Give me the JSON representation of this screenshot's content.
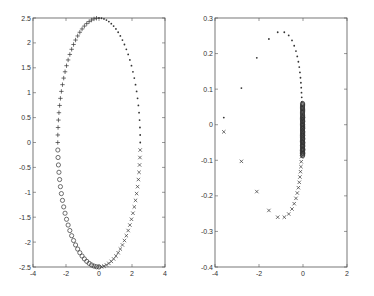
{
  "chart_data": [
    {
      "type": "scatter",
      "title": "",
      "xlabel": "",
      "ylabel": "",
      "xlim": [
        -4,
        4
      ],
      "ylim": [
        -2.5,
        2.5
      ],
      "xticks": [
        -4,
        -2,
        0,
        2,
        4
      ],
      "yticks": [
        -2.5,
        -2,
        -1.5,
        -1,
        -0.5,
        0,
        0.5,
        1,
        1.5,
        2,
        2.5
      ],
      "grid": false,
      "legend": null,
      "box": {
        "left": 33,
        "top": 18,
        "right": 165,
        "bottom": 267
      },
      "description": "Ellipse x=2.5cos(t), y=2.5sin(t) sampled; marker depends on quadrant",
      "series": [
        {
          "name": "upper-left",
          "marker": "+",
          "x_range": [
            -2.5,
            0
          ],
          "y_range": [
            0,
            2.5
          ]
        },
        {
          "name": "upper-right",
          "marker": ".",
          "x_range": [
            0,
            2.5
          ],
          "y_range": [
            0,
            2.5
          ]
        },
        {
          "name": "lower-left",
          "marker": "o",
          "x_range": [
            -2.5,
            0
          ],
          "y_range": [
            -2.5,
            0
          ]
        },
        {
          "name": "lower-right",
          "marker": "x",
          "x_range": [
            0,
            2.5
          ],
          "y_range": [
            -2.5,
            0
          ]
        }
      ],
      "params": {
        "a": 2.5,
        "b": 2.5,
        "n_per_quadrant": 26
      }
    },
    {
      "type": "scatter",
      "title": "",
      "xlabel": "",
      "ylabel": "",
      "xlim": [
        -4,
        2
      ],
      "ylim": [
        -0.4,
        0.3
      ],
      "xticks": [
        -4,
        -2,
        0,
        2
      ],
      "yticks": [
        -0.4,
        -0.3,
        -0.2,
        -0.1,
        0,
        0.1,
        0.2,
        0.3
      ],
      "grid": false,
      "legend": null,
      "box": {
        "left": 215,
        "top": 18,
        "right": 347,
        "bottom": 267
      },
      "series": [
        {
          "name": "upper",
          "marker": ".",
          "points": [
            [
              -3.6,
              0.02
            ],
            [
              -2.8,
              0.103
            ],
            [
              -2.1,
              0.188
            ],
            [
              -1.55,
              0.241
            ],
            [
              -1.15,
              0.26
            ],
            [
              -0.85,
              0.26
            ],
            [
              -0.65,
              0.251
            ],
            [
              -0.5,
              0.237
            ],
            [
              -0.4,
              0.222
            ],
            [
              -0.32,
              0.207
            ],
            [
              -0.26,
              0.192
            ],
            [
              -0.21,
              0.177
            ],
            [
              -0.17,
              0.162
            ],
            [
              -0.14,
              0.147
            ],
            [
              -0.115,
              0.132
            ],
            [
              -0.095,
              0.118
            ],
            [
              -0.08,
              0.104
            ],
            [
              -0.068,
              0.09
            ],
            [
              -0.058,
              0.077
            ],
            [
              -0.05,
              0.064
            ],
            [
              -0.043,
              0.052
            ],
            [
              -0.037,
              0.041
            ],
            [
              -0.032,
              0.03
            ],
            [
              -0.027,
              0.02
            ],
            [
              -0.022,
              0.011
            ],
            [
              -0.018,
              0.004
            ]
          ]
        },
        {
          "name": "lower",
          "marker": "x",
          "points": [
            [
              -3.6,
              -0.02
            ],
            [
              -2.8,
              -0.103
            ],
            [
              -2.1,
              -0.188
            ],
            [
              -1.55,
              -0.241
            ],
            [
              -1.15,
              -0.26
            ],
            [
              -0.85,
              -0.26
            ],
            [
              -0.65,
              -0.251
            ],
            [
              -0.5,
              -0.237
            ],
            [
              -0.4,
              -0.222
            ],
            [
              -0.32,
              -0.207
            ],
            [
              -0.26,
              -0.192
            ],
            [
              -0.21,
              -0.177
            ],
            [
              -0.17,
              -0.162
            ],
            [
              -0.14,
              -0.147
            ],
            [
              -0.115,
              -0.132
            ],
            [
              -0.095,
              -0.118
            ],
            [
              -0.08,
              -0.104
            ],
            [
              -0.068,
              -0.09
            ],
            [
              -0.058,
              -0.077
            ],
            [
              -0.05,
              -0.064
            ],
            [
              -0.043,
              -0.052
            ],
            [
              -0.037,
              -0.041
            ],
            [
              -0.032,
              -0.03
            ],
            [
              -0.027,
              -0.02
            ],
            [
              -0.022,
              -0.011
            ],
            [
              -0.018,
              -0.004
            ]
          ]
        },
        {
          "name": "center",
          "marker": "o",
          "points": [
            [
              -0.01,
              0.02
            ],
            [
              -0.012,
              0.01
            ],
            [
              -0.014,
              0.0
            ],
            [
              -0.013,
              -0.01
            ],
            [
              -0.011,
              -0.02
            ],
            [
              -0.009,
              -0.03
            ],
            [
              -0.008,
              -0.04
            ],
            [
              -0.007,
              -0.05
            ],
            [
              -0.006,
              -0.06
            ],
            [
              -0.005,
              -0.07
            ],
            [
              -0.004,
              -0.08
            ]
          ]
        }
      ]
    }
  ]
}
